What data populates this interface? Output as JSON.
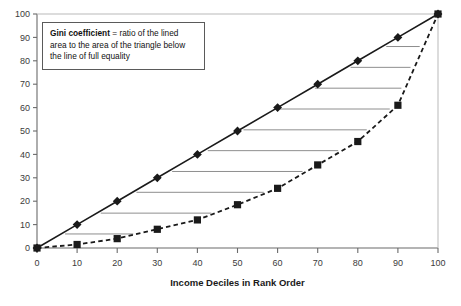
{
  "annotation": {
    "term": "Gini coefficient",
    "equals": "=",
    "definition": "ratio of the lined area to the area of the triangle below the line of full equality"
  },
  "axes": {
    "x_title": "Income Deciles in Rank Order",
    "y_title": "",
    "x_ticks": [
      "0",
      "10",
      "20",
      "30",
      "40",
      "50",
      "60",
      "70",
      "80",
      "90",
      "100"
    ],
    "y_ticks": [
      "0",
      "10",
      "20",
      "30",
      "40",
      "50",
      "60",
      "70",
      "80",
      "90",
      "100"
    ]
  },
  "colors": {
    "line": "#1a1a1a",
    "marker": "#1a1a1a",
    "hatch": "#8e8e8e",
    "axis": "#6b6b6b",
    "box_border": "#5a5a5a",
    "background": "#ffffff"
  },
  "chart_data": {
    "type": "line",
    "title": "",
    "subtitle": "",
    "xlabel": "Income Deciles in Rank Order",
    "ylabel": "",
    "xlim": [
      0,
      100
    ],
    "ylim": [
      0,
      100
    ],
    "xticks": [
      0,
      10,
      20,
      30,
      40,
      50,
      60,
      70,
      80,
      90,
      100
    ],
    "yticks": [
      0,
      10,
      20,
      30,
      40,
      50,
      60,
      70,
      80,
      90,
      100
    ],
    "grid": false,
    "legend": "none",
    "x": [
      0,
      10,
      20,
      30,
      40,
      50,
      60,
      70,
      80,
      90,
      100
    ],
    "series": [
      {
        "name": "Line of full equality",
        "marker": "diamond",
        "linestyle": "solid",
        "values": [
          0,
          10,
          20,
          30,
          40,
          50,
          60,
          70,
          80,
          90,
          100
        ]
      },
      {
        "name": "Lorenz curve",
        "marker": "square",
        "linestyle": "dashed",
        "values": [
          0,
          1.5,
          4,
          8,
          12,
          18.5,
          25.5,
          35.5,
          45.5,
          61,
          100
        ]
      }
    ],
    "annotations": [
      {
        "text": "Gini coefficient = ratio of the lined area to the area of the triangle below the line of full equality",
        "position": "top-left"
      }
    ],
    "shaded_region": {
      "description": "horizontal lined (hatched) area between the line of full equality and the Lorenz curve",
      "style": "horizontal-lines"
    }
  }
}
